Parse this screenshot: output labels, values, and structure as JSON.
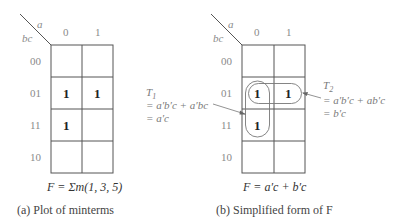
{
  "map_a": {
    "var_col": "a",
    "var_row": "bc",
    "col_labels": [
      "0",
      "1"
    ],
    "row_labels": [
      "00",
      "01",
      "11",
      "10"
    ],
    "cells": [
      [
        "",
        ""
      ],
      [
        "1",
        "1"
      ],
      [
        "1",
        ""
      ],
      [
        "",
        ""
      ]
    ],
    "function": "F = Σm(1, 3, 5)",
    "caption": "(a)  Plot of minterms"
  },
  "map_b": {
    "var_col": "a",
    "var_row": "bc",
    "col_labels": [
      "0",
      "1"
    ],
    "row_labels": [
      "00",
      "01",
      "11",
      "10"
    ],
    "cells": [
      [
        "",
        ""
      ],
      [
        "1",
        "1"
      ],
      [
        "1",
        ""
      ],
      [
        "",
        ""
      ]
    ],
    "function": "F = a′c + b′c",
    "caption": "(b)  Simplified form of F",
    "groups": [
      {
        "name": "T1",
        "line1": "T",
        "sub": "1",
        "line2": "= a′b′c + a′bc",
        "line3": "= a′c"
      },
      {
        "name": "T2",
        "line1": "T",
        "sub": "2",
        "line2": "= a′b′c + ab′c",
        "line3": "= b′c"
      }
    ]
  }
}
